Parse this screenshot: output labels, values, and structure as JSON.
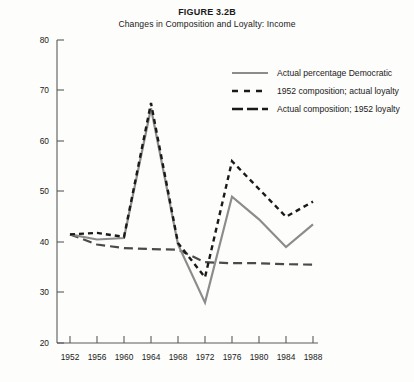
{
  "figure": {
    "title": "FIGURE 3.2B",
    "subtitle": "Changes in Composition and Loyalty: Income"
  },
  "chart_data": {
    "type": "line",
    "title": "FIGURE 3.2B",
    "subtitle": "Changes in Composition and Loyalty: Income",
    "xlabel": "",
    "ylabel": "",
    "x": [
      1952,
      1956,
      1960,
      1964,
      1968,
      1972,
      1976,
      1980,
      1984,
      1988
    ],
    "categories": [
      "1952",
      "1956",
      "1960",
      "1964",
      "1968",
      "1972",
      "1976",
      "1980",
      "1984",
      "1988"
    ],
    "xlim": [
      1950,
      1990
    ],
    "ylim": [
      20,
      80
    ],
    "ytick_values": [
      20,
      30,
      40,
      50,
      60,
      70,
      80
    ],
    "ytick_labels": [
      "20",
      "30",
      "40",
      "50",
      "60",
      "70",
      "80"
    ],
    "grid": false,
    "legend_position": "upper right",
    "series": [
      {
        "name": "Actual percentage Democratic",
        "style": "solid",
        "color": "#8c8c8c",
        "values": [
          41.5,
          40.5,
          40.8,
          66.5,
          39.5,
          28.0,
          49.0,
          44.5,
          39.0,
          43.5
        ]
      },
      {
        "name": "1952 composition; actual loyalty",
        "style": "dashed-short",
        "color": "#1a1a1a",
        "values": [
          41.5,
          41.8,
          41.0,
          67.5,
          39.8,
          33.0,
          56.0,
          50.5,
          45.0,
          48.0
        ]
      },
      {
        "name": "Actual composition; 1952 loyalty",
        "style": "dashed-long",
        "color": "#4a4a4a",
        "values": [
          41.5,
          39.5,
          38.8,
          38.6,
          38.5,
          36.0,
          35.8,
          35.8,
          35.6,
          35.5
        ]
      }
    ]
  },
  "legend": {
    "items": [
      {
        "label": "Actual percentage Democratic",
        "swatch": "solid-gray-line"
      },
      {
        "label": "1952 composition; actual loyalty",
        "swatch": "short-dashed-black-line"
      },
      {
        "label": "Actual composition; 1952 loyalty",
        "swatch": "long-dashed-black-line"
      }
    ]
  }
}
